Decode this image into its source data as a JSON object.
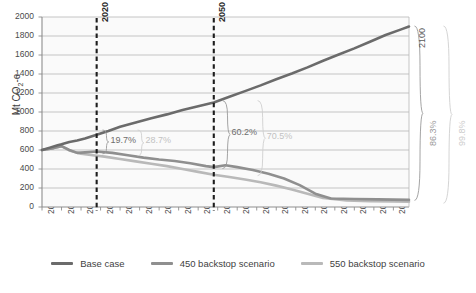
{
  "chart_data": {
    "type": "line",
    "title": "",
    "xlabel": "",
    "ylabel": "Mt CO2-e",
    "ylabel_prefix": "Mt CO",
    "ylabel_sub": "2",
    "ylabel_suffix": "-e",
    "xlim": [
      2006,
      2100
    ],
    "ylim": [
      0,
      2000
    ],
    "ytick_step": 200,
    "yticks": [
      "0",
      "200",
      "400",
      "600",
      "800",
      "1000",
      "1200",
      "1400",
      "1600",
      "1800",
      "2000"
    ],
    "xticks": [
      "2006",
      "2011",
      "2016",
      "2021",
      "2026",
      "2031",
      "2036",
      "2041",
      "2046",
      "2051",
      "2056",
      "2061",
      "2066",
      "2071",
      "2076",
      "2081",
      "2086",
      "2091",
      "2096"
    ],
    "grid": true,
    "legend_position": "bottom",
    "series": [
      {
        "name": "Base case",
        "color": "#6b6b6b",
        "x": [
          2006,
          2008,
          2010,
          2011,
          2013,
          2015,
          2017,
          2020,
          2023,
          2026,
          2030,
          2034,
          2038,
          2042,
          2046,
          2050,
          2054,
          2058,
          2062,
          2066,
          2070,
          2074,
          2078,
          2082,
          2086,
          2090,
          2094,
          2098,
          2100
        ],
        "values": [
          600,
          625,
          650,
          660,
          685,
          700,
          720,
          760,
          800,
          845,
          890,
          935,
          975,
          1020,
          1060,
          1100,
          1160,
          1220,
          1280,
          1345,
          1405,
          1470,
          1540,
          1605,
          1670,
          1740,
          1810,
          1870,
          1900
        ]
      },
      {
        "name": "450 backstop scenario",
        "color": "#8f8f8f",
        "x": [
          2006,
          2009,
          2011,
          2013,
          2015,
          2017,
          2020,
          2024,
          2028,
          2032,
          2036,
          2040,
          2044,
          2048,
          2050,
          2053,
          2056,
          2060,
          2064,
          2068,
          2072,
          2076,
          2080,
          2086,
          2092,
          2100
        ],
        "values": [
          600,
          620,
          640,
          600,
          570,
          575,
          585,
          570,
          545,
          520,
          500,
          485,
          460,
          430,
          420,
          440,
          420,
          390,
          350,
          300,
          230,
          140,
          90,
          85,
          80,
          75
        ]
      },
      {
        "name": "550 backstop scenario",
        "color": "#b9b9b9",
        "x": [
          2006,
          2009,
          2011,
          2013,
          2016,
          2019,
          2022,
          2026,
          2030,
          2034,
          2038,
          2042,
          2046,
          2050,
          2054,
          2058,
          2062,
          2066,
          2070,
          2074,
          2078,
          2084,
          2090,
          2096,
          2100
        ],
        "values": [
          600,
          620,
          640,
          595,
          560,
          545,
          530,
          505,
          480,
          455,
          430,
          400,
          370,
          340,
          315,
          290,
          260,
          225,
          185,
          140,
          95,
          70,
          62,
          58,
          55
        ]
      }
    ],
    "vlines": [
      {
        "year": "2020",
        "label": "2020"
      },
      {
        "year": "2050",
        "label": "2050"
      }
    ],
    "annotations": [
      {
        "label": "19.7%",
        "tone": "dark",
        "group": "2020"
      },
      {
        "label": "28.7%",
        "tone": "light",
        "group": "2020"
      },
      {
        "label": "60.2%",
        "tone": "dark",
        "group": "2050"
      },
      {
        "label": "70.5%",
        "tone": "light",
        "group": "2050"
      },
      {
        "label": "86.3%",
        "tone": "dark",
        "group": "2100"
      },
      {
        "label": "99.8%",
        "tone": "light",
        "group": "2100"
      },
      {
        "label": "2100",
        "tone": "year",
        "group": "2100"
      }
    ]
  },
  "legend": {
    "items": [
      {
        "label": "Base case",
        "color": "#6b6b6b"
      },
      {
        "label": "450 backstop scenario",
        "color": "#8f8f8f"
      },
      {
        "label": "550 backstop scenario",
        "color": "#b9b9b9"
      }
    ]
  }
}
